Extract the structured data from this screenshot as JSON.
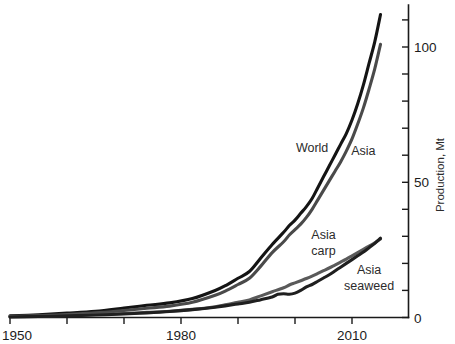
{
  "chart_data": {
    "type": "line",
    "title": "",
    "subtitle": "",
    "xlabel": "",
    "ylabel": "Production, Mt",
    "xlim": [
      1950,
      2016
    ],
    "ylim": [
      0,
      115
    ],
    "xticks": [
      1950,
      1960,
      1970,
      1980,
      1990,
      2000,
      2010
    ],
    "xtick_labels": [
      "1950",
      "",
      "",
      "1980",
      "",
      "",
      "2010"
    ],
    "yticks": [
      0,
      10,
      20,
      30,
      40,
      50,
      60,
      70,
      80,
      90,
      100,
      110
    ],
    "ytick_labels": [
      "0",
      "",
      "",
      "",
      "",
      "50",
      "",
      "",
      "",
      "",
      "100",
      ""
    ],
    "grid": false,
    "legend": "inline-annotations",
    "annotations": [
      {
        "text": "World",
        "x": 2003,
        "y": 61,
        "color": "#1a1a1a"
      },
      {
        "text": "Asia",
        "x": 2012,
        "y": 60,
        "color": "#4a4a4a"
      },
      {
        "text": "Asia",
        "x": 2005,
        "y": 29,
        "color": "#4a4a4a"
      },
      {
        "text": "carp",
        "x": 2005,
        "y": 23,
        "color": "#4a4a4a"
      },
      {
        "text": "Asia",
        "x": 2013,
        "y": 16,
        "color": "#2b2b2b"
      },
      {
        "text": "seaweed",
        "x": 2013,
        "y": 10,
        "color": "#2b2b2b"
      }
    ],
    "series": [
      {
        "name": "World",
        "color": "#141414",
        "width": 3.1,
        "x": [
          1950,
          1955,
          1960,
          1965,
          1970,
          1974,
          1978,
          1982,
          1986,
          1988,
          1990,
          1992,
          1994,
          1996,
          1998,
          1999,
          2000,
          2001,
          2002,
          2003,
          2004,
          2005,
          2006,
          2007,
          2008,
          2009,
          2010,
          2011,
          2012,
          2013,
          2014,
          2015
        ],
        "y": [
          0.6,
          1.0,
          1.6,
          2.3,
          3.5,
          4.5,
          5.4,
          7.0,
          10.0,
          12.0,
          14.5,
          17.0,
          22.0,
          27.0,
          31.5,
          34.0,
          36.0,
          38.5,
          41.0,
          44.0,
          48.0,
          52.0,
          56.0,
          60.0,
          64.0,
          68.0,
          73.0,
          79.0,
          86.0,
          94.0,
          102.0,
          112.0
        ]
      },
      {
        "name": "Asia",
        "color": "#4a4a4a",
        "width": 3.1,
        "x": [
          1950,
          1955,
          1960,
          1965,
          1970,
          1974,
          1978,
          1982,
          1986,
          1988,
          1990,
          1992,
          1994,
          1996,
          1998,
          1999,
          2000,
          2001,
          2002,
          2003,
          2004,
          2005,
          2006,
          2007,
          2008,
          2009,
          2010,
          2011,
          2012,
          2013,
          2014,
          2015
        ],
        "y": [
          0.4,
          0.7,
          1.1,
          1.7,
          2.6,
          3.4,
          4.2,
          5.6,
          8.2,
          10.0,
          12.2,
          14.5,
          19.0,
          24.0,
          28.0,
          30.5,
          32.5,
          34.5,
          37.0,
          40.0,
          43.5,
          47.0,
          50.5,
          54.0,
          57.5,
          61.5,
          66.0,
          71.5,
          77.5,
          84.5,
          92.0,
          101.0
        ]
      },
      {
        "name": "Asia carp",
        "color": "#5a5a5a",
        "width": 3.1,
        "x": [
          1950,
          1955,
          1960,
          1965,
          1970,
          1974,
          1978,
          1982,
          1986,
          1988,
          1990,
          1992,
          1994,
          1996,
          1998,
          1999,
          2000,
          2001,
          2002,
          2003,
          2004,
          2005,
          2006,
          2007,
          2008,
          2009,
          2010,
          2011,
          2012,
          2013,
          2014,
          2015
        ],
        "y": [
          0.3,
          0.5,
          0.8,
          1.1,
          1.5,
          1.9,
          2.3,
          3.0,
          4.0,
          4.8,
          5.6,
          6.5,
          8.0,
          9.5,
          11.0,
          12.0,
          12.8,
          13.6,
          14.4,
          15.3,
          16.3,
          17.3,
          18.3,
          19.4,
          20.5,
          21.6,
          22.8,
          24.0,
          25.2,
          26.4,
          27.6,
          29.0
        ]
      },
      {
        "name": "Asia seaweed",
        "color": "#1f1f1f",
        "width": 3.1,
        "x": [
          1950,
          1955,
          1960,
          1965,
          1970,
          1974,
          1978,
          1982,
          1986,
          1988,
          1990,
          1992,
          1994,
          1996,
          1997,
          1998,
          1999,
          2000,
          2001,
          2002,
          2003,
          2004,
          2005,
          2006,
          2007,
          2008,
          2009,
          2010,
          2011,
          2012,
          2013,
          2014,
          2015
        ],
        "y": [
          0.2,
          0.4,
          0.6,
          0.9,
          1.3,
          1.7,
          2.2,
          2.9,
          3.8,
          4.4,
          5.0,
          5.6,
          6.6,
          7.6,
          8.6,
          8.8,
          8.6,
          9.0,
          10.0,
          11.3,
          12.2,
          13.4,
          14.6,
          15.8,
          17.2,
          18.6,
          20.0,
          21.4,
          22.8,
          24.2,
          25.8,
          27.4,
          29.3
        ]
      }
    ]
  },
  "axis": {
    "y_title": "Production, Mt",
    "x_labels": [
      "1950",
      "1980",
      "2010"
    ],
    "y_labels": [
      "0",
      "50",
      "100"
    ]
  }
}
